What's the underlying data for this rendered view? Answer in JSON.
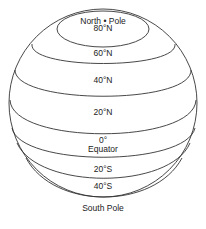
{
  "diagram": {
    "labels": {
      "north_pole": "North • Pole",
      "lat_80n": "80°N",
      "lat_60n": "60°N",
      "lat_40n": "40°N",
      "lat_20n": "20°N",
      "lat_0": "0°",
      "equator": "Equator",
      "lat_20s": "20°S",
      "lat_40s": "40°S",
      "south_pole": "South Pole"
    },
    "colors": {
      "line": "#333333",
      "text": "#222222",
      "background": "#ffffff"
    }
  }
}
